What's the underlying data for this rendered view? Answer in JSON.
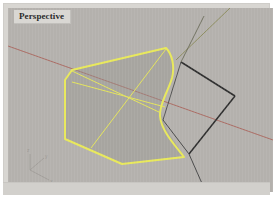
{
  "app": {
    "name": "rhino-3d-viewport"
  },
  "viewport": {
    "title": "Perspective",
    "background_color": "#b4b1ad",
    "frame_color": "#d8d6d2"
  },
  "axis_gizmo": {
    "labels": {
      "z": "z",
      "y": "y",
      "x": "x"
    },
    "color": "#8b8884"
  },
  "world_axes": [
    {
      "name": "x-axis-line",
      "color": "#a8584f",
      "x1": 0,
      "y1": 38,
      "x2": 265,
      "y2": 132
    },
    {
      "name": "y-axis-line",
      "color": "#8a8a58",
      "x1": 168,
      "y1": 52,
      "x2": 222,
      "y2": 0
    }
  ],
  "geometry": {
    "selected_surface": {
      "name": "selected-surface",
      "edge_color": "#e8e85a",
      "fill_color": "rgba(150,147,143,0.45)",
      "outline_points": "64,62 158,40 163,45 166,58 163,72 156,87 152,99 155,112 162,127 176,148 114,156 57,131 57,72",
      "isocurves": [
        {
          "name": "isocurve-diagonal-a",
          "points": "64,74 156,97"
        },
        {
          "name": "isocurve-diagonal-b",
          "points": "158,41 83,140"
        },
        {
          "name": "isocurve-diagonal-c",
          "points": "64,64 152,104"
        }
      ]
    },
    "wireframe_edges": {
      "name": "wireframe-edges",
      "color": "#2e2e2e",
      "segments": [
        {
          "name": "edge-top-right",
          "points": "173,54 227,88"
        },
        {
          "name": "edge-right-lower",
          "points": "227,88 181,146"
        },
        {
          "name": "edge-left-lower",
          "points": "181,146 155,112"
        },
        {
          "name": "edge-upper-left",
          "points": "155,112 173,54"
        },
        {
          "name": "edge-spur-down",
          "points": "181,146 196,180"
        },
        {
          "name": "edge-spur-up",
          "points": "173,54 196,8"
        }
      ]
    }
  }
}
